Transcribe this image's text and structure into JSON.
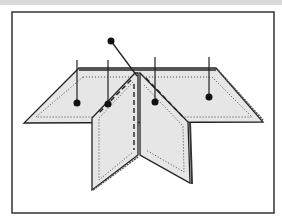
{
  "figure": {
    "colors": {
      "panel_fill": "#e6e6e6",
      "stroke": "#222222",
      "frame": "#333333",
      "topbar": "#d8d8d8"
    },
    "pins": [
      {
        "name": "pin-top",
        "knob": [
          111,
          41
        ],
        "end": [
          137,
          76
        ]
      },
      {
        "name": "pin-back-left",
        "top": [
          77,
          60
        ],
        "knob": [
          77,
          103
        ]
      },
      {
        "name": "pin-back-left-2",
        "top": [
          108,
          60
        ],
        "knob": [
          108,
          104
        ]
      },
      {
        "name": "pin-back-center",
        "top": [
          155,
          57
        ],
        "knob": [
          155,
          102
        ]
      },
      {
        "name": "pin-back-right",
        "top": [
          209,
          57
        ],
        "knob": [
          209,
          97
        ]
      }
    ]
  }
}
